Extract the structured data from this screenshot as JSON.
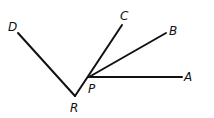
{
  "diagram": {
    "type": "geometry-rays",
    "stroke_color": "#111111",
    "background": "#ffffff",
    "points": {
      "D": {
        "label": "D",
        "x": 18,
        "y": 33,
        "lx": 8,
        "ly": 31
      },
      "R": {
        "label": "R",
        "x": 75,
        "y": 96,
        "lx": 70,
        "ly": 112
      },
      "P": {
        "label": "P",
        "x": 89,
        "y": 77,
        "lx": 88,
        "ly": 93
      },
      "C": {
        "label": "C",
        "x": 122,
        "y": 25,
        "lx": 120,
        "ly": 20
      },
      "B": {
        "label": "B",
        "x": 166,
        "y": 33,
        "lx": 169,
        "ly": 35
      },
      "A": {
        "label": "A",
        "x": 182,
        "y": 77,
        "lx": 184,
        "ly": 81
      }
    },
    "segments": [
      {
        "from": "D",
        "to": "R"
      },
      {
        "from": "R",
        "to": "C"
      },
      {
        "from": "P",
        "to": "B"
      },
      {
        "from": "P",
        "to": "A"
      }
    ]
  }
}
